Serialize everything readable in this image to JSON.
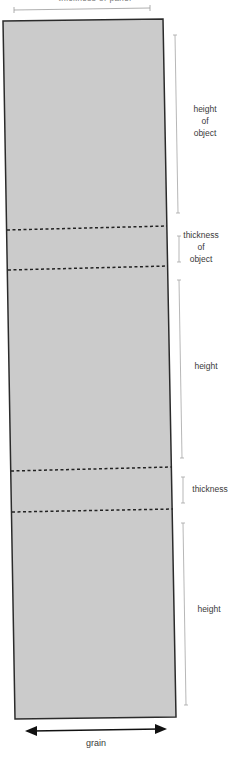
{
  "diagram": {
    "top_caption": "thickness of panel",
    "colors": {
      "board_fill": "#cbcbcb",
      "board_border": "#2b2b2b",
      "dash": "#222222",
      "dimension_line": "#9a9a9a",
      "arrow": "#111111",
      "text": "#3a3a3a"
    },
    "segments": [
      {
        "label_lines": [
          "height",
          "of",
          "object"
        ],
        "kind": "height"
      },
      {
        "label_lines": [
          "thickness",
          "of",
          "object"
        ],
        "kind": "thickness"
      },
      {
        "label_lines": [
          "height"
        ],
        "kind": "height"
      },
      {
        "label_lines": [
          "thickness"
        ],
        "kind": "thickness"
      },
      {
        "label_lines": [
          "height"
        ],
        "kind": "height"
      }
    ],
    "grain_label": "grain"
  }
}
